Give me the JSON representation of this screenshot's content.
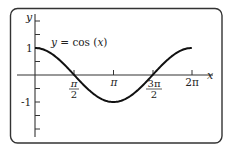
{
  "chart_data": {
    "type": "line",
    "title": "",
    "annotation": "y = cos (x)",
    "xlabel": "x",
    "ylabel": "y",
    "xlim": [
      0,
      6.6
    ],
    "ylim": [
      -2.3,
      2.3
    ],
    "grid": false,
    "legend": "none",
    "x_ticks": [
      {
        "value": 1.5708,
        "label_num": "π",
        "label_den": "2"
      },
      {
        "value": 3.1416,
        "label": "π"
      },
      {
        "value": 4.7124,
        "label_num": "3π",
        "label_den": "2"
      },
      {
        "value": 6.2832,
        "label": "2π"
      }
    ],
    "y_ticks": [
      {
        "value": 2.0,
        "label": ""
      },
      {
        "value": 1.5,
        "label": ""
      },
      {
        "value": 1.0,
        "label": "1"
      },
      {
        "value": 0.5,
        "label": ""
      },
      {
        "value": -0.5,
        "label": ""
      },
      {
        "value": -1.0,
        "label": "-1"
      },
      {
        "value": -1.5,
        "label": ""
      },
      {
        "value": -2.0,
        "label": ""
      }
    ],
    "series": [
      {
        "name": "y = cos (x)",
        "function": "cos(x)",
        "x": [
          0,
          0.7854,
          1.5708,
          2.3562,
          3.1416,
          3.927,
          4.7124,
          5.4978,
          6.2832
        ],
        "y": [
          1,
          0.707,
          0,
          -0.707,
          -1,
          -0.707,
          0,
          0.707,
          1
        ]
      }
    ]
  },
  "labels": {
    "y_axis": "y",
    "x_axis": "x",
    "curve": "y = cos (x)",
    "one": "1",
    "minus_one": "-1",
    "pi_over_2_num": "π",
    "pi_over_2_den": "2",
    "pi": "π",
    "three_pi_over_2_num": "3π",
    "three_pi_over_2_den": "2",
    "two_pi": "2π"
  },
  "colors": {
    "frame": "#333333",
    "axis": "#333333",
    "curve": "#111111",
    "text": "#222222"
  }
}
